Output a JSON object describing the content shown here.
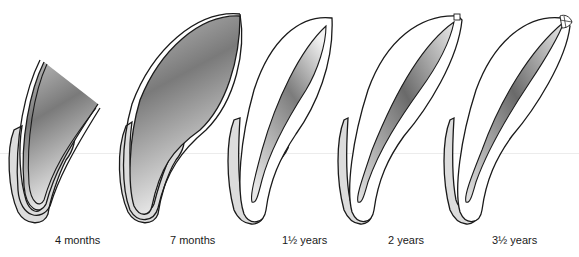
{
  "figure": {
    "colors": {
      "outline": "#1a1a1a",
      "enamel_dentin": "#ffffff",
      "pulp_dark": "#6e6e6e",
      "pulp_light": "#e8e8e8",
      "bone_gingiva": "#dcdcdc"
    },
    "stages": [
      {
        "label": "4 months",
        "x": 62
      },
      {
        "label": "7 months",
        "x": 171
      },
      {
        "label": "1½ years",
        "x": 280
      },
      {
        "label": "2 years",
        "x": 388
      },
      {
        "label": "3½ years",
        "x": 493
      }
    ]
  }
}
